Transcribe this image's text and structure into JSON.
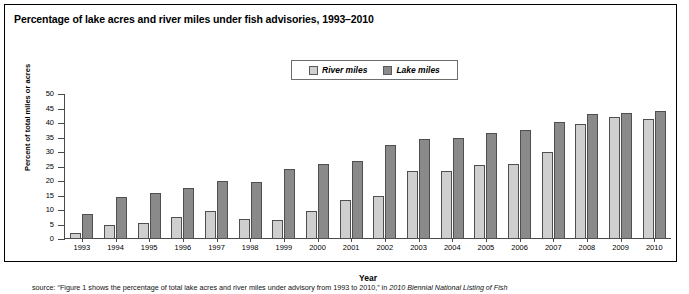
{
  "figure": {
    "title": "Percentage of lake acres and river miles under fish advisories, 1993–2010",
    "source_prefix": "source: ",
    "source_quote": "“Figure 1 shows the percentage of total lake acres and river miles under advisory from 1993 to 2010,” in ",
    "source_italic": "2010 Biennial National Listing of Fish"
  },
  "legend": {
    "position": "top-center",
    "entries": [
      {
        "label": "River miles",
        "color": "#cfcfcf",
        "swatch_icon": "legend-swatch-river"
      },
      {
        "label": "Lake miles",
        "color": "#8a8a8a",
        "swatch_icon": "legend-swatch-lake"
      }
    ]
  },
  "chart_data": {
    "type": "bar",
    "title": "Percentage of lake acres and river miles under fish advisories, 1993–2010",
    "xlabel": "Year",
    "ylabel": "Percent of total miles or acres",
    "ylim": [
      0,
      50
    ],
    "ytick_step": 5,
    "yticks": [
      0,
      5,
      10,
      15,
      20,
      25,
      30,
      35,
      40,
      45,
      50
    ],
    "grid": false,
    "legend_position": "top-center",
    "categories": [
      "1993",
      "1994",
      "1995",
      "1996",
      "1997",
      "1998",
      "1999",
      "2000",
      "2001",
      "2002",
      "2003",
      "2004",
      "2005",
      "2006",
      "2007",
      "2008",
      "2009",
      "2010"
    ],
    "series": [
      {
        "name": "River miles",
        "color": "#cfcfcf",
        "values": [
          2,
          5,
          5.5,
          7.5,
          9.5,
          7,
          6.5,
          9.5,
          13.5,
          15,
          23.5,
          23.5,
          25.5,
          26,
          30,
          39.5,
          42,
          41.5
        ]
      },
      {
        "name": "Lake miles",
        "color": "#8a8a8a",
        "values": [
          8.5,
          14.5,
          16,
          17.5,
          20,
          19.5,
          24,
          26,
          27,
          32.5,
          34.5,
          35,
          36.5,
          37.5,
          40.5,
          43,
          43.5,
          44
        ]
      }
    ]
  }
}
